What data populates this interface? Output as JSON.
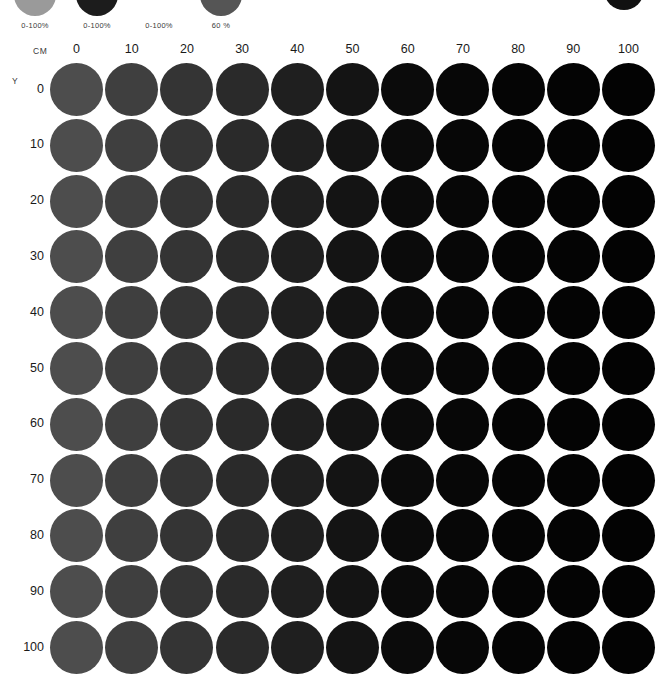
{
  "chart_data": {
    "type": "heatmap",
    "xlabel": "CM",
    "ylabel": "Y",
    "grid": false,
    "legend": "none",
    "categories": [
      "0",
      "10",
      "20",
      "30",
      "40",
      "50",
      "60",
      "70",
      "80",
      "90",
      "100"
    ],
    "rows": [
      "0",
      "10",
      "20",
      "30",
      "40",
      "50",
      "60",
      "70",
      "80",
      "90",
      "100"
    ],
    "xlim": [
      0,
      100
    ],
    "ylim": [
      0,
      100
    ],
    "column_colors": [
      "#4d4d4d",
      "#3f3f3f",
      "#343434",
      "#2a2a2a",
      "#1f1f1f",
      "#141414",
      "#0b0b0b",
      "#070707",
      "#050505",
      "#040404",
      "#030303"
    ],
    "values": [
      [
        0,
        10,
        20,
        30,
        40,
        50,
        60,
        70,
        80,
        90,
        100
      ],
      [
        0,
        10,
        20,
        30,
        40,
        50,
        60,
        70,
        80,
        90,
        100
      ],
      [
        0,
        10,
        20,
        30,
        40,
        50,
        60,
        70,
        80,
        90,
        100
      ],
      [
        0,
        10,
        20,
        30,
        40,
        50,
        60,
        70,
        80,
        90,
        100
      ],
      [
        0,
        10,
        20,
        30,
        40,
        50,
        60,
        70,
        80,
        90,
        100
      ],
      [
        0,
        10,
        20,
        30,
        40,
        50,
        60,
        70,
        80,
        90,
        100
      ],
      [
        0,
        10,
        20,
        30,
        40,
        50,
        60,
        70,
        80,
        90,
        100
      ],
      [
        0,
        10,
        20,
        30,
        40,
        50,
        60,
        70,
        80,
        90,
        100
      ],
      [
        0,
        10,
        20,
        30,
        40,
        50,
        60,
        70,
        80,
        90,
        100
      ],
      [
        0,
        10,
        20,
        30,
        40,
        50,
        60,
        70,
        80,
        90,
        100
      ],
      [
        0,
        10,
        20,
        30,
        40,
        50,
        60,
        70,
        80,
        90,
        100
      ]
    ]
  },
  "swatch_strip": {
    "swatches": [
      {
        "label": "0-100%",
        "color": "#9a9a9a",
        "x": 4
      },
      {
        "label": "0-100%",
        "color": "#1c1c1c",
        "x": 66
      },
      {
        "label": "0-100%",
        "color": "#ffffff",
        "x": 128
      },
      {
        "label": "60 %",
        "color": "#555555",
        "x": 190
      }
    ],
    "corner_swatch_color": "#111111"
  },
  "axes": {
    "column_axis_name": "CM",
    "row_axis_name": "Y",
    "column_labels": [
      "0",
      "10",
      "20",
      "30",
      "40",
      "50",
      "60",
      "70",
      "80",
      "90",
      "100"
    ],
    "row_labels": [
      "0",
      "10",
      "20",
      "30",
      "40",
      "50",
      "60",
      "70",
      "80",
      "90",
      "100"
    ]
  }
}
